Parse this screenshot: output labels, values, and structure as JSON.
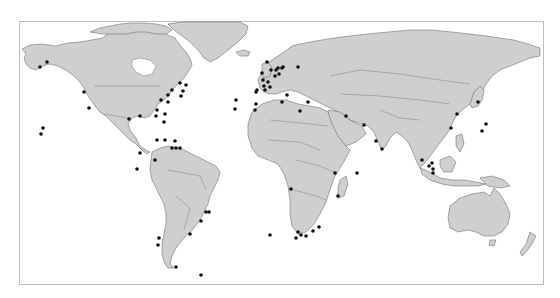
{
  "map": {
    "type": "world-map",
    "projection": "equirectangular",
    "land_color": "#cfcfcf",
    "coast_color": "#5a5a5a",
    "ocean_color": "#ffffff",
    "marker_color": "#111111",
    "marker_radius": 1.8,
    "frame": {
      "x": 19,
      "y": 21,
      "width": 525,
      "height": 264,
      "border_color": "#bdbdbd"
    }
  },
  "markers": [
    {
      "region": "Alaska",
      "x": 40,
      "y": 67
    },
    {
      "region": "Alaska",
      "x": 47,
      "y": 62
    },
    {
      "region": "US West Coast",
      "x": 84,
      "y": 92
    },
    {
      "region": "US West Coast",
      "x": 89,
      "y": 108
    },
    {
      "region": "Hawaii",
      "x": 43,
      "y": 128
    },
    {
      "region": "Hawaii",
      "x": 41,
      "y": 134
    },
    {
      "region": "Gulf of Mexico",
      "x": 129,
      "y": 119
    },
    {
      "region": "Gulf of Mexico",
      "x": 140,
      "y": 116
    },
    {
      "region": "US East Coast",
      "x": 161,
      "y": 100
    },
    {
      "region": "US East Coast",
      "x": 168,
      "y": 95
    },
    {
      "region": "US East Coast",
      "x": 172,
      "y": 90
    },
    {
      "region": "US East Coast",
      "x": 180,
      "y": 83
    },
    {
      "region": "US East Coast",
      "x": 186,
      "y": 85
    },
    {
      "region": "US East Coast",
      "x": 183,
      "y": 91
    },
    {
      "region": "US East Coast",
      "x": 181,
      "y": 96
    },
    {
      "region": "US East Coast",
      "x": 168,
      "y": 102
    },
    {
      "region": "Atlantic",
      "x": 157,
      "y": 110
    },
    {
      "region": "Atlantic",
      "x": 165,
      "y": 114
    },
    {
      "region": "Atlantic",
      "x": 156,
      "y": 116
    },
    {
      "region": "Atlantic",
      "x": 164,
      "y": 122
    },
    {
      "region": "Caribbean",
      "x": 157,
      "y": 140
    },
    {
      "region": "Caribbean",
      "x": 165,
      "y": 140
    },
    {
      "region": "Caribbean",
      "x": 175,
      "y": 141
    },
    {
      "region": "Caribbean",
      "x": 172,
      "y": 148
    },
    {
      "region": "Caribbean",
      "x": 176,
      "y": 148
    },
    {
      "region": "Caribbean",
      "x": 180,
      "y": 148
    },
    {
      "region": "Central America",
      "x": 140,
      "y": 153
    },
    {
      "region": "Pacific Colombia",
      "x": 155,
      "y": 160
    },
    {
      "region": "Pacific Ecuador",
      "x": 137,
      "y": 169
    },
    {
      "region": "Brazil SE",
      "x": 206,
      "y": 212
    },
    {
      "region": "Brazil SE",
      "x": 209,
      "y": 212
    },
    {
      "region": "Brazil S",
      "x": 201,
      "y": 221
    },
    {
      "region": "Uruguay",
      "x": 190,
      "y": 234
    },
    {
      "region": "Chile",
      "x": 159,
      "y": 238
    },
    {
      "region": "Chile",
      "x": 158,
      "y": 245
    },
    {
      "region": "Tierra del Fuego",
      "x": 176,
      "y": 267
    },
    {
      "region": "South Atlantic",
      "x": 201,
      "y": 275
    },
    {
      "region": "South Atlantic",
      "x": 270,
      "y": 235
    },
    {
      "region": "Mid-Atlantic",
      "x": 236,
      "y": 100
    },
    {
      "region": "Mid-Atlantic",
      "x": 235,
      "y": 109
    },
    {
      "region": "Iberia",
      "x": 256,
      "y": 104
    },
    {
      "region": "Iberia",
      "x": 255,
      "y": 110
    },
    {
      "region": "Iberia",
      "x": 257,
      "y": 90
    },
    {
      "region": "Bay of Biscay",
      "x": 256,
      "y": 92
    },
    {
      "region": "UK",
      "x": 267,
      "y": 62
    },
    {
      "region": "UK",
      "x": 271,
      "y": 70
    },
    {
      "region": "UK",
      "x": 262,
      "y": 73
    },
    {
      "region": "UK",
      "x": 263,
      "y": 80
    },
    {
      "region": "France",
      "x": 264,
      "y": 86
    },
    {
      "region": "France",
      "x": 268,
      "y": 82
    },
    {
      "region": "France",
      "x": 265,
      "y": 90
    },
    {
      "region": "France",
      "x": 270,
      "y": 87
    },
    {
      "region": "North Sea",
      "x": 276,
      "y": 70
    },
    {
      "region": "North Sea",
      "x": 275,
      "y": 76
    },
    {
      "region": "Netherlands",
      "x": 279,
      "y": 74
    },
    {
      "region": "Baltic",
      "x": 283,
      "y": 67
    },
    {
      "region": "Denmark",
      "x": 282,
      "y": 68
    },
    {
      "region": "Germany",
      "x": 278,
      "y": 68
    },
    {
      "region": "Sweden",
      "x": 298,
      "y": 67
    },
    {
      "region": "Mediterranean",
      "x": 287,
      "y": 95
    },
    {
      "region": "Italy",
      "x": 282,
      "y": 102
    },
    {
      "region": "Greece",
      "x": 308,
      "y": 102
    },
    {
      "region": "Libya",
      "x": 300,
      "y": 111
    },
    {
      "region": "Persian Gulf",
      "x": 346,
      "y": 116
    },
    {
      "region": "Oman",
      "x": 364,
      "y": 125
    },
    {
      "region": "Arabian Sea",
      "x": 376,
      "y": 141
    },
    {
      "region": "Arabian Sea",
      "x": 382,
      "y": 149
    },
    {
      "region": "Indian Ocean",
      "x": 357,
      "y": 173
    },
    {
      "region": "Madagascar",
      "x": 338,
      "y": 196
    },
    {
      "region": "Mozambique",
      "x": 335,
      "y": 173
    },
    {
      "region": "Angola",
      "x": 291,
      "y": 189
    },
    {
      "region": "South Africa",
      "x": 298,
      "y": 232
    },
    {
      "region": "South Africa",
      "x": 301,
      "y": 235
    },
    {
      "region": "South Africa",
      "x": 306,
      "y": 236
    },
    {
      "region": "South Africa",
      "x": 296,
      "y": 238
    },
    {
      "region": "South Africa",
      "x": 313,
      "y": 231
    },
    {
      "region": "South Africa",
      "x": 319,
      "y": 227
    },
    {
      "region": "China East",
      "x": 457,
      "y": 114
    },
    {
      "region": "China South",
      "x": 451,
      "y": 128
    },
    {
      "region": "Japan",
      "x": 478,
      "y": 102
    },
    {
      "region": "Pacific",
      "x": 486,
      "y": 124
    },
    {
      "region": "Pacific",
      "x": 482,
      "y": 131
    },
    {
      "region": "Malaysia",
      "x": 422,
      "y": 160
    },
    {
      "region": "Singapore",
      "x": 429,
      "y": 166
    },
    {
      "region": "Singapore",
      "x": 432,
      "y": 163
    },
    {
      "region": "Indonesia",
      "x": 433,
      "y": 169
    },
    {
      "region": "Indonesia",
      "x": 433,
      "y": 173
    }
  ]
}
